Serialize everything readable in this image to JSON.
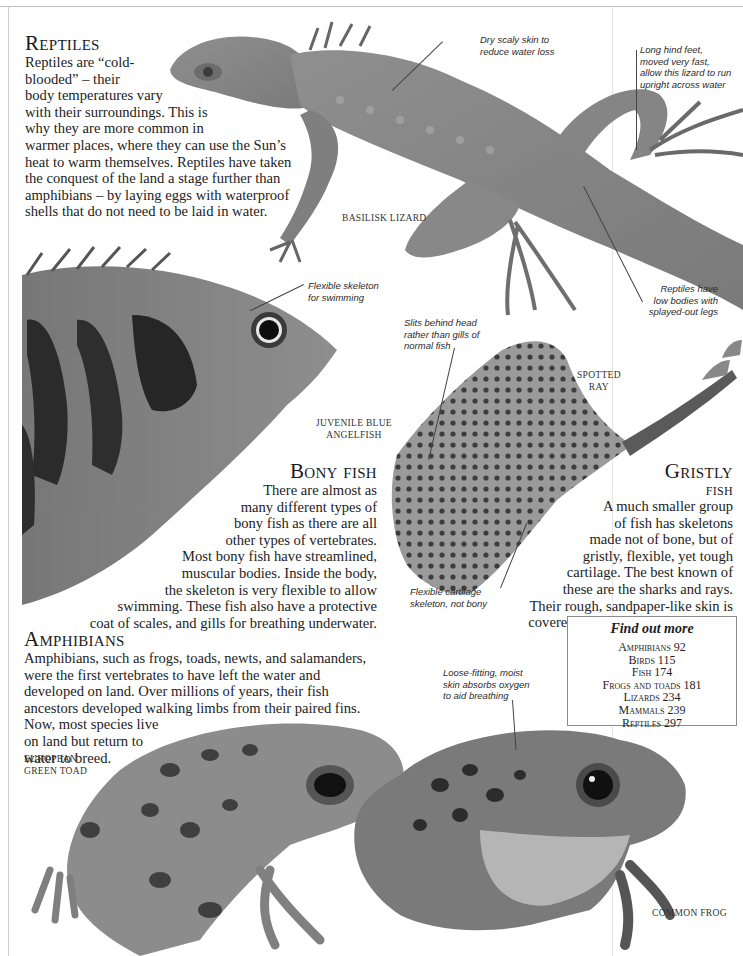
{
  "sections": {
    "reptiles": {
      "heading": "Reptiles",
      "lines": [
        "Reptiles are “cold-",
        "blooded” – their",
        "body temperatures vary",
        "with their surroundings. This is",
        "why they are more common in",
        "warmer places, where they can use the Sun’s",
        "heat to warm themselves. Reptiles have taken",
        "the conquest of the land a stage further than",
        "amphibians – by laying eggs with waterproof",
        "shells that do not need to be laid in water."
      ]
    },
    "bony_fish": {
      "heading": "Bony fish",
      "lines": [
        "There are almost as",
        "many different types of",
        "bony fish as there are all",
        "other types of vertebrates.",
        "Most bony fish have streamlined,",
        "muscular bodies. Inside the body,",
        "the skeleton is very flexible to allow",
        "swimming. These fish also have a protective",
        "coat of scales, and gills for breathing underwater."
      ]
    },
    "gristly_fish": {
      "heading_1": "Gristly",
      "heading_2": "fish",
      "lines": [
        "A much smaller group",
        "of fish has skeletons",
        "made not of bone, but of",
        "gristly, flexible, yet tough",
        "cartilage. The best known of",
        "these are the sharks and rays.",
        "Their rough, sandpaper-like skin is",
        "covered with tiny tooth-like scales."
      ]
    },
    "amphibians": {
      "heading": "Amphibians",
      "lines": [
        "Amphibians, such as frogs, toads, newts, and salamanders,",
        "were the first vertebrates to have left the water and",
        "developed on land. Over millions of years, their fish",
        "ancestors developed walking limbs from their paired fins.",
        "Now, most species live",
        "on land but return to",
        "water to breed."
      ]
    }
  },
  "captions": {
    "basilisk": "Basilisk lizard",
    "angelfish_1": "Juvenile blue",
    "angelfish_2": "angelfish",
    "ray_1": "Spotted",
    "ray_2": "ray",
    "toad_1": "European",
    "toad_2": "green toad",
    "frog": "Common frog"
  },
  "annotations": {
    "dry_skin": [
      "Dry scaly skin to",
      "reduce water loss"
    ],
    "hind_feet": [
      "Long hind feet,",
      "moved very fast,",
      "allow this lizard to run",
      "upright across water"
    ],
    "low_bodies": [
      "Reptiles have",
      "low bodies with",
      "splayed-out legs"
    ],
    "flex_skeleton": [
      "Flexible skeleton",
      "for swimming"
    ],
    "slits": [
      "Slits behind head",
      "rather than gills of",
      "normal fish"
    ],
    "cartilage": [
      "Flexible cartilage",
      "skeleton, not bony"
    ],
    "moist_skin": [
      "Loose-fitting, moist",
      "skin absorbs oxygen",
      "to aid breathing"
    ]
  },
  "find_out_more": {
    "title": "Find out more",
    "items": [
      {
        "name": "Amphibians",
        "page": "92"
      },
      {
        "name": "Birds",
        "page": "115"
      },
      {
        "name": "Fish",
        "page": "174"
      },
      {
        "name": "Frogs and toads",
        "page": "181"
      },
      {
        "name": "Lizards",
        "page": "234"
      },
      {
        "name": "Mammals",
        "page": "239"
      },
      {
        "name": "Reptiles",
        "page": "297"
      }
    ]
  }
}
